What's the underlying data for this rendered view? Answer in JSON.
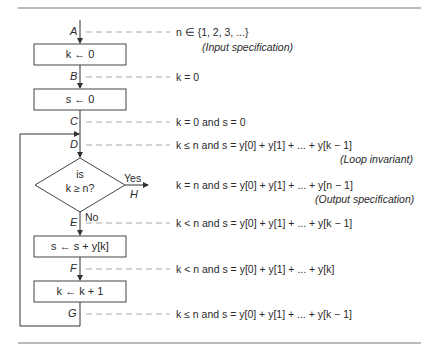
{
  "diagram": {
    "type": "flowchart",
    "boxes": [
      {
        "id": "init-k",
        "label": "k ← 0"
      },
      {
        "id": "init-s",
        "label": "s ← 0"
      },
      {
        "id": "add",
        "label": "s ← s + y[k]"
      },
      {
        "id": "incr",
        "label": "k ← k + 1"
      }
    ],
    "decision": {
      "line1": "is",
      "line2": "k ≥ n?",
      "yes_label": "Yes",
      "no_label": "No"
    },
    "points": [
      {
        "label": "A",
        "assertion": "n ∈ {1, 2, 3, ...}",
        "note": "(Input specification)"
      },
      {
        "label": "B",
        "assertion": "k = 0"
      },
      {
        "label": "C",
        "assertion": "k = 0 and s = 0"
      },
      {
        "label": "D",
        "assertion": "k ≤ n and s = y[0] + y[1] + ... + y[k − 1]",
        "note": "(Loop invariant)"
      },
      {
        "label": "H",
        "assertion": "k = n and s = y[0] + y[1] + ... + y[n − 1]",
        "note": "(Output specification)"
      },
      {
        "label": "E",
        "assertion": "k < n and s = y[0] + y[1] + ... + y[k − 1]"
      },
      {
        "label": "F",
        "assertion": "k < n and s = y[0] + y[1] + ... + y[k]"
      },
      {
        "label": "G",
        "assertion": "k ≤ n and s = y[0] + y[1] + ... + y[k − 1]"
      }
    ]
  }
}
